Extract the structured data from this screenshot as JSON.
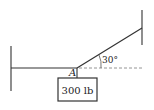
{
  "diagram": {
    "type": "statics-free-body",
    "point_label": "A",
    "angle_label": "30°",
    "weight_label": "300 lb",
    "colors": {
      "line": "#333333",
      "dashed": "#888888",
      "background": "#ffffff"
    }
  }
}
